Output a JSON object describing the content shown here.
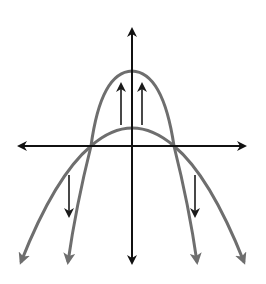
{
  "diagram": {
    "colors": {
      "axis": "#111111",
      "curve": "#6e6e6e",
      "transform_arrow": "#1a1a1a",
      "background": "#ffffff"
    },
    "axes": {
      "origin": [
        132,
        146
      ],
      "x_axis": {
        "from": [
          17,
          146
        ],
        "to": [
          247,
          146
        ],
        "arrows": "both"
      },
      "y_axis": {
        "from": [
          132,
          265
        ],
        "to": [
          132,
          27
        ],
        "arrows": "both"
      }
    },
    "curves": [
      {
        "name": "wide-parabola",
        "vertex": [
          132,
          128
        ],
        "x_intercepts": [
          91,
          174
        ],
        "left_end": [
          19,
          265
        ],
        "right_end": [
          246,
          265
        ]
      },
      {
        "name": "narrow-parabola",
        "vertex": [
          132,
          71
        ],
        "x_intercepts": [
          91,
          174
        ],
        "left_end": [
          67,
          265
        ],
        "right_end": [
          198,
          265
        ]
      }
    ],
    "transform_arrows": [
      {
        "name": "up-arrow-left",
        "x": 121,
        "from_y": 125,
        "to_y": 82
      },
      {
        "name": "up-arrow-right",
        "x": 142,
        "from_y": 125,
        "to_y": 82
      },
      {
        "name": "down-arrow-left",
        "x": 69,
        "from_y": 175,
        "to_y": 218
      },
      {
        "name": "down-arrow-right",
        "x": 195,
        "from_y": 175,
        "to_y": 218
      }
    ]
  }
}
